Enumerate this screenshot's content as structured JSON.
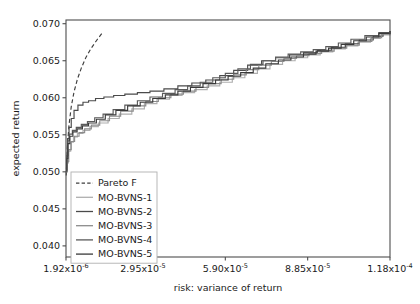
{
  "chart_data": {
    "type": "line",
    "title": "",
    "xlabel": "risk: variance of return",
    "ylabel": "expected return",
    "grid": false,
    "legend_position": "lower left",
    "xlim": [
      1.92e-06,
      0.000118
    ],
    "ylim": [
      0.0385,
      0.0705
    ],
    "xticks": [
      1.92e-06,
      2.95e-05,
      5.9e-05,
      8.85e-05,
      0.000118
    ],
    "xtick_labels": [
      "1.92x10",
      "2.95x10",
      "5.90x10",
      "8.85x10",
      "1.18x10"
    ],
    "xtick_exponents": [
      "-6",
      "-5",
      "-5",
      "-5",
      "-4"
    ],
    "yticks": [
      0.04,
      0.045,
      0.05,
      0.055,
      0.06,
      0.065,
      0.07
    ],
    "ytick_labels": [
      "0.040",
      "0.045",
      "0.050",
      "0.055",
      "0.060",
      "0.065",
      "0.070"
    ],
    "series": [
      {
        "name": "Pareto F",
        "style": "dashed",
        "color": "#3f3f3f",
        "x": [
          2e-06,
          2.4e-06,
          3e-06,
          3.8e-06,
          4.8e-06,
          6e-06,
          7.4e-06,
          9e-06,
          1.08e-05,
          1.28e-05,
          1.5e-05
        ],
        "y": [
          0.0495,
          0.0533,
          0.0563,
          0.0588,
          0.0608,
          0.0625,
          0.064,
          0.0654,
          0.0666,
          0.0677,
          0.0688
        ]
      },
      {
        "name": "MO-BVNS-1",
        "style": "solid",
        "color": "#aeaeae",
        "x": [
          2e-06,
          2.3e-06,
          2.8e-06,
          3.6e-06,
          4.6e-06,
          6e-06,
          8e-06,
          1.05e-05,
          1.35e-05,
          1.7e-05,
          2.1e-05,
          2.55e-05,
          3e-05,
          3.45e-05,
          3.9e-05,
          4.35e-05,
          4.8e-05,
          5.25e-05,
          5.7e-05,
          6.15e-05,
          6.6e-05,
          7.05e-05,
          7.5e-05,
          7.95e-05,
          8.4e-05,
          8.85e-05,
          9.3e-05,
          9.75e-05,
          0.000102,
          0.0001065,
          0.000111,
          0.0001145,
          0.000118
        ],
        "y": [
          0.05,
          0.0512,
          0.0528,
          0.054,
          0.0547,
          0.0552,
          0.0556,
          0.0561,
          0.0566,
          0.0572,
          0.0578,
          0.0585,
          0.0592,
          0.0598,
          0.0603,
          0.0607,
          0.0611,
          0.0616,
          0.0621,
          0.0627,
          0.0633,
          0.0639,
          0.0645,
          0.065,
          0.0654,
          0.0658,
          0.0662,
          0.0666,
          0.067,
          0.0675,
          0.068,
          0.0685,
          0.069
        ]
      },
      {
        "name": "MO-BVNS-2",
        "style": "solid",
        "color": "#4a4a4a",
        "x": [
          2e-06,
          2.2e-06,
          2.5e-06,
          3e-06,
          3.8e-06,
          4.8e-06,
          6.2e-06,
          8e-06,
          1e-05,
          1.25e-05,
          1.55e-05,
          1.9e-05,
          2.3e-05,
          2.75e-05,
          3.2e-05,
          3.7e-05,
          4.2e-05,
          4.7e-05,
          5.2e-05,
          5.7e-05,
          6.2e-05,
          6.7e-05,
          7.2e-05,
          7.7e-05,
          8.2e-05,
          8.7e-05,
          9.2e-05,
          9.7e-05,
          0.000102,
          0.000107,
          0.000112,
          0.0001155,
          0.000118
        ],
        "y": [
          0.0502,
          0.052,
          0.0545,
          0.056,
          0.0572,
          0.0583,
          0.059,
          0.0594,
          0.0596,
          0.0599,
          0.0601,
          0.0603,
          0.0605,
          0.0607,
          0.0609,
          0.0612,
          0.0616,
          0.062,
          0.0624,
          0.063,
          0.0637,
          0.0644,
          0.065,
          0.0654,
          0.0658,
          0.0661,
          0.0664,
          0.0668,
          0.0673,
          0.0678,
          0.0683,
          0.0687,
          0.069
        ]
      },
      {
        "name": "MO-BVNS-3",
        "style": "solid",
        "color": "#8c8c8c",
        "x": [
          2e-06,
          2.3e-06,
          2.9e-06,
          3.8e-06,
          5e-06,
          6.6e-06,
          8.6e-06,
          1.1e-05,
          1.4e-05,
          1.75e-05,
          2.15e-05,
          2.6e-05,
          3.05e-05,
          3.5e-05,
          3.95e-05,
          4.4e-05,
          4.85e-05,
          5.3e-05,
          5.75e-05,
          6.2e-05,
          6.65e-05,
          7.1e-05,
          7.55e-05,
          8e-05,
          8.45e-05,
          8.9e-05,
          9.35e-05,
          9.8e-05,
          0.0001025,
          0.000107,
          0.0001115,
          0.000115,
          0.000118
        ],
        "y": [
          0.05,
          0.0514,
          0.053,
          0.0541,
          0.0548,
          0.0553,
          0.0558,
          0.0563,
          0.0569,
          0.0575,
          0.0582,
          0.0589,
          0.0595,
          0.06,
          0.0605,
          0.0609,
          0.0614,
          0.0619,
          0.0625,
          0.0631,
          0.0638,
          0.0644,
          0.0649,
          0.0653,
          0.0657,
          0.066,
          0.0663,
          0.0667,
          0.0671,
          0.0676,
          0.0681,
          0.0686,
          0.069
        ]
      },
      {
        "name": "MO-BVNS-4",
        "style": "solid",
        "color": "#5a5a5a",
        "x": [
          2e-06,
          2.2e-06,
          2.6e-06,
          3.2e-06,
          4.2e-06,
          5.6e-06,
          7.4e-06,
          9.6e-06,
          1.22e-05,
          1.52e-05,
          1.88e-05,
          2.3e-05,
          2.75e-05,
          3.2e-05,
          3.65e-05,
          4.1e-05,
          4.55e-05,
          5e-05,
          5.45e-05,
          5.9e-05,
          6.35e-05,
          6.8e-05,
          7.25e-05,
          7.7e-05,
          8.15e-05,
          8.6e-05,
          9.05e-05,
          9.5e-05,
          9.95e-05,
          0.000104,
          0.000109,
          0.000114,
          0.000118
        ],
        "y": [
          0.0503,
          0.0522,
          0.0542,
          0.0551,
          0.0556,
          0.056,
          0.0564,
          0.0568,
          0.0573,
          0.0578,
          0.0584,
          0.059,
          0.0596,
          0.0601,
          0.0606,
          0.0611,
          0.0616,
          0.0621,
          0.0627,
          0.0633,
          0.0639,
          0.0645,
          0.065,
          0.0655,
          0.0659,
          0.0662,
          0.0665,
          0.0669,
          0.0674,
          0.0679,
          0.0684,
          0.0688,
          0.069
        ]
      },
      {
        "name": "MO-BVNS-5",
        "style": "solid",
        "color": "#3a3a3a",
        "x": [
          2e-06,
          2.2e-06,
          2.6e-06,
          3.3e-06,
          4.4e-06,
          5.9e-06,
          7.8e-06,
          1e-05,
          1.28e-05,
          1.6e-05,
          1.98e-05,
          2.4e-05,
          2.85e-05,
          3.3e-05,
          3.75e-05,
          4.2e-05,
          4.65e-05,
          5.1e-05,
          5.55e-05,
          6e-05,
          6.45e-05,
          6.9e-05,
          7.35e-05,
          7.8e-05,
          8.25e-05,
          8.7e-05,
          9.15e-05,
          9.6e-05,
          0.0001005,
          0.000105,
          0.0001095,
          0.000114,
          0.000118
        ],
        "y": [
          0.0501,
          0.0518,
          0.0538,
          0.0548,
          0.0554,
          0.0558,
          0.0562,
          0.0566,
          0.0571,
          0.0577,
          0.0583,
          0.0589,
          0.0594,
          0.0599,
          0.0604,
          0.0609,
          0.0614,
          0.0619,
          0.0624,
          0.0629,
          0.0634,
          0.064,
          0.0646,
          0.0651,
          0.0655,
          0.0659,
          0.0663,
          0.0667,
          0.0672,
          0.0677,
          0.0682,
          0.0687,
          0.069
        ]
      }
    ],
    "legend_entries": [
      {
        "label": "Pareto F",
        "color": "#3f3f3f",
        "style": "dashed"
      },
      {
        "label": "MO-BVNS-1",
        "color": "#aeaeae",
        "style": "solid"
      },
      {
        "label": "MO-BVNS-2",
        "color": "#4a4a4a",
        "style": "solid"
      },
      {
        "label": "MO-BVNS-3",
        "color": "#8c8c8c",
        "style": "solid"
      },
      {
        "label": "MO-BVNS-4",
        "color": "#5a5a5a",
        "style": "solid"
      },
      {
        "label": "MO-BVNS-5",
        "color": "#3a3a3a",
        "style": "solid"
      }
    ]
  }
}
